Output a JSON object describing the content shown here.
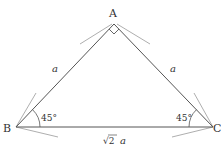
{
  "diagram": {
    "type": "right isosceles triangle",
    "vertices": [
      {
        "id": "A",
        "label": "A",
        "x": 114,
        "y": 24
      },
      {
        "id": "B",
        "label": "B",
        "x": 16,
        "y": 127
      },
      {
        "id": "C",
        "label": "C",
        "x": 213,
        "y": 127
      }
    ],
    "sides": {
      "AB": {
        "label": "a"
      },
      "AC": {
        "label": "a"
      },
      "BC": {
        "label_radical": "√2",
        "label_var": "a"
      }
    },
    "angles": {
      "A": {
        "marker": "right-angle"
      },
      "B": {
        "label": "45°"
      },
      "C": {
        "label": "45°"
      }
    },
    "colors": {
      "line": "#555555",
      "construction": "#999999",
      "text": "#333333"
    }
  }
}
